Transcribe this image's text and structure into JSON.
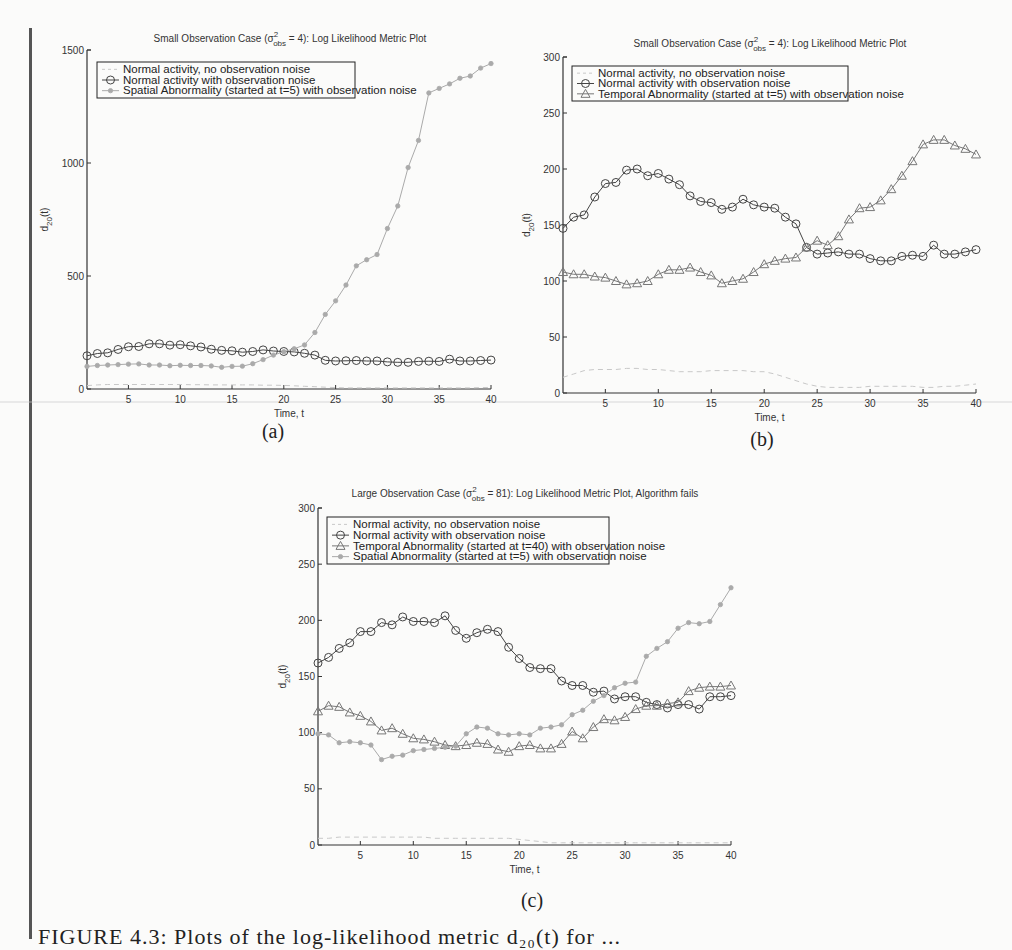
{
  "caption": "FIGURE 4.3: Plots of the log-likelihood metric d₂₀(t) for ...",
  "colors": {
    "dark": "#444444",
    "light": "#aaaaaa",
    "dashed": "#c8c8c8",
    "axis": "#333333"
  },
  "chart_data": [
    {
      "id": "a",
      "type": "line",
      "panel_label": "(a)",
      "title": "Small Observation Case (σ²obs = 4): Log Likelihood Metric Plot",
      "title_parts": {
        "pre": "Small Observation Case (σ",
        "sup": "2",
        "sub": "obs",
        "post": " = 4): Log Likelihood Metric Plot"
      },
      "xlabel": "Time, t",
      "ylabel": "d20(t)",
      "xlim": [
        1,
        40
      ],
      "ylim": [
        0,
        1500
      ],
      "xticks": [
        5,
        10,
        15,
        20,
        25,
        30,
        35,
        40
      ],
      "yticks": [
        0,
        500,
        1000,
        1500
      ],
      "legend_position": "top-left",
      "x": [
        1,
        2,
        3,
        4,
        5,
        6,
        7,
        8,
        9,
        10,
        11,
        12,
        13,
        14,
        15,
        16,
        17,
        18,
        19,
        20,
        21,
        22,
        23,
        24,
        25,
        26,
        27,
        28,
        29,
        30,
        31,
        32,
        33,
        34,
        35,
        36,
        37,
        38,
        39,
        40
      ],
      "series": [
        {
          "name": "Normal activity, no observation noise",
          "style": "dashed",
          "marker": "none",
          "values": [
            15,
            18,
            20,
            20,
            20,
            20,
            20,
            20,
            20,
            20,
            19,
            19,
            18,
            18,
            18,
            18,
            18,
            17,
            17,
            16,
            14,
            12,
            10,
            8,
            6,
            5,
            5,
            5,
            5,
            5,
            5,
            5,
            5,
            5,
            5,
            5,
            5,
            5,
            6,
            7
          ]
        },
        {
          "name": "Normal activity with observation noise",
          "style": "solid-dark",
          "marker": "circle",
          "values": [
            147,
            157,
            160,
            175,
            187,
            188,
            200,
            200,
            194,
            196,
            191,
            186,
            176,
            171,
            169,
            163,
            166,
            173,
            168,
            166,
            164,
            158,
            150,
            127,
            124,
            125,
            126,
            124,
            124,
            120,
            118,
            118,
            122,
            123,
            122,
            132,
            124,
            124,
            126,
            128
          ]
        },
        {
          "name": "Spatial Abnormality (started at t=5) with observation noise",
          "style": "solid-light",
          "marker": "star",
          "values": [
            100,
            104,
            106,
            108,
            110,
            111,
            106,
            106,
            103,
            105,
            104,
            104,
            102,
            96,
            100,
            101,
            112,
            130,
            150,
            165,
            178,
            195,
            250,
            330,
            390,
            460,
            545,
            572,
            595,
            710,
            810,
            980,
            1100,
            1310,
            1330,
            1350,
            1375,
            1385,
            1420,
            1440
          ]
        }
      ]
    },
    {
      "id": "b",
      "type": "line",
      "panel_label": "(b)",
      "title": "Small Observation Case (σ²obs = 4): Log Likelihood Metric Plot",
      "title_parts": {
        "pre": "Small Observation Case (σ",
        "sup": "2",
        "sub": "obs",
        "post": " = 4): Log Likelihood Metric Plot"
      },
      "xlabel": "Time, t",
      "ylabel": "d20(t)",
      "xlim": [
        1,
        40
      ],
      "ylim": [
        0,
        300
      ],
      "xticks": [
        5,
        10,
        15,
        20,
        25,
        30,
        35,
        40
      ],
      "yticks": [
        0,
        50,
        100,
        150,
        200,
        250,
        300
      ],
      "legend_position": "top-left",
      "x": [
        1,
        2,
        3,
        4,
        5,
        6,
        7,
        8,
        9,
        10,
        11,
        12,
        13,
        14,
        15,
        16,
        17,
        18,
        19,
        20,
        21,
        22,
        23,
        24,
        25,
        26,
        27,
        28,
        29,
        30,
        31,
        32,
        33,
        34,
        35,
        36,
        37,
        38,
        39,
        40
      ],
      "series": [
        {
          "name": "Normal activity, no observation noise",
          "style": "dashed",
          "marker": "none",
          "values": [
            14,
            17,
            20,
            21,
            21,
            21,
            22,
            22,
            21,
            21,
            20,
            19,
            19,
            19,
            20,
            20,
            20,
            20,
            19,
            19,
            17,
            14,
            11,
            8,
            6,
            5,
            5,
            5,
            5,
            6,
            6,
            6,
            6,
            6,
            5,
            5,
            6,
            6,
            7,
            8
          ]
        },
        {
          "name": "Normal activity with observation noise",
          "style": "solid-dark",
          "marker": "circle",
          "values": [
            147,
            157,
            159,
            175,
            187,
            188,
            199,
            200,
            194,
            196,
            191,
            186,
            176,
            171,
            170,
            164,
            166,
            173,
            168,
            166,
            165,
            157,
            151,
            130,
            124,
            125,
            126,
            124,
            124,
            120,
            118,
            118,
            122,
            123,
            122,
            132,
            124,
            124,
            126,
            128
          ]
        },
        {
          "name": "Temporal Abnormality (started at t=5) with observation noise",
          "style": "solid-mid",
          "marker": "triangle",
          "values": [
            108,
            106,
            106,
            104,
            103,
            100,
            97,
            98,
            100,
            106,
            110,
            110,
            112,
            108,
            105,
            98,
            100,
            102,
            108,
            115,
            118,
            120,
            121,
            130,
            136,
            132,
            140,
            155,
            165,
            166,
            172,
            182,
            194,
            207,
            222,
            226,
            226,
            221,
            218,
            213
          ]
        }
      ]
    },
    {
      "id": "c",
      "type": "line",
      "panel_label": "(c)",
      "title": "Large Observation Case (σ²obs = 81): Log Likelihood Metric Plot, Algorithm fails",
      "title_parts": {
        "pre": "Large Observation Case (σ",
        "sup": "2",
        "sub": "obs",
        "post": " = 81): Log Likelihood Metric Plot, Algorithm fails"
      },
      "xlabel": "Time, t",
      "ylabel": "d20(t)",
      "xlim": [
        1,
        40
      ],
      "ylim": [
        0,
        300
      ],
      "xticks": [
        5,
        10,
        15,
        20,
        25,
        30,
        35,
        40
      ],
      "yticks": [
        0,
        50,
        100,
        150,
        200,
        250,
        300
      ],
      "legend_position": "top-left",
      "x": [
        1,
        2,
        3,
        4,
        5,
        6,
        7,
        8,
        9,
        10,
        11,
        12,
        13,
        14,
        15,
        16,
        17,
        18,
        19,
        20,
        21,
        22,
        23,
        24,
        25,
        26,
        27,
        28,
        29,
        30,
        31,
        32,
        33,
        34,
        35,
        36,
        37,
        38,
        39,
        40
      ],
      "series": [
        {
          "name": "Normal activity, no observation noise",
          "style": "dashed",
          "marker": "none",
          "values": [
            6,
            6,
            7,
            7,
            7,
            7,
            7,
            7,
            7,
            7,
            7,
            6,
            6,
            6,
            6,
            6,
            6,
            6,
            6,
            5,
            4,
            3,
            2,
            2,
            2,
            2,
            2,
            2,
            2,
            2,
            2,
            2,
            2,
            2,
            2,
            2,
            2,
            2,
            2,
            2
          ]
        },
        {
          "name": "Normal activity with observation noise",
          "style": "solid-dark",
          "marker": "circle",
          "values": [
            162,
            167,
            175,
            180,
            190,
            190,
            198,
            196,
            203,
            199,
            199,
            198,
            204,
            191,
            184,
            189,
            192,
            190,
            176,
            166,
            158,
            157,
            157,
            146,
            142,
            142,
            136,
            137,
            130,
            132,
            132,
            127,
            125,
            122,
            125,
            125,
            121,
            132,
            132,
            133
          ]
        },
        {
          "name": "Temporal Abnormality (started at t=40) with observation noise",
          "style": "solid-mid",
          "marker": "triangle",
          "values": [
            119,
            124,
            123,
            118,
            115,
            110,
            102,
            104,
            99,
            95,
            94,
            92,
            89,
            88,
            89,
            91,
            90,
            85,
            83,
            88,
            89,
            86,
            86,
            90,
            101,
            95,
            105,
            112,
            111,
            114,
            121,
            124,
            124,
            126,
            127,
            137,
            140,
            141,
            141,
            142
          ]
        },
        {
          "name": "Spatial Abnormality (started at t=5) with observation noise",
          "style": "solid-light",
          "marker": "star",
          "values": [
            99,
            98,
            91,
            92,
            91,
            89,
            76,
            79,
            80,
            84,
            85,
            86,
            87,
            88,
            99,
            105,
            104,
            99,
            98,
            99,
            98,
            104,
            105,
            107,
            116,
            120,
            128,
            133,
            140,
            144,
            145,
            168,
            175,
            181,
            193,
            198,
            197,
            199,
            214,
            229
          ]
        }
      ]
    }
  ]
}
